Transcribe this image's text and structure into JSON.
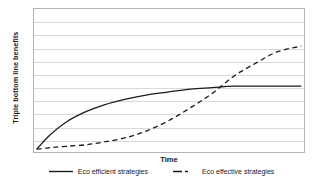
{
  "chart_data": {
    "type": "line",
    "title": "",
    "xlabel": "Time",
    "ylabel": "Triple bottom line benefits",
    "xlim": [
      0,
      100
    ],
    "ylim": [
      0,
      100
    ],
    "grid": true,
    "grid_lines": 10,
    "axis_ticks_shown": false,
    "legend_position": "bottom",
    "crossover": {
      "x": 69,
      "y": 43
    },
    "series": [
      {
        "name": "Eco efficient strategies",
        "style": "solid",
        "color": "#1a1a1a",
        "shape": "concave-logarithmic",
        "x": [
          1,
          6,
          12,
          19,
          26,
          34,
          42,
          50,
          58,
          66,
          74,
          82,
          90,
          99
        ],
        "values": [
          2,
          12,
          21,
          28,
          33,
          37,
          40,
          42,
          44,
          45,
          46,
          46,
          46,
          46
        ]
      },
      {
        "name": "Eco effective strategies",
        "style": "dashed",
        "color": "#1a1a1a",
        "shape": "sigmoid-s-curve",
        "x": [
          1,
          6,
          12,
          19,
          26,
          34,
          42,
          50,
          58,
          66,
          74,
          82,
          90,
          99
        ],
        "values": [
          2,
          3,
          4,
          5,
          7,
          10,
          15,
          22,
          31,
          41,
          53,
          62,
          70,
          74
        ]
      }
    ]
  },
  "axes": {
    "x_title": "Time",
    "y_title": "Triple bottom line benefits"
  },
  "legend": {
    "items": [
      {
        "label": "Eco efficient strategies",
        "style": "solid"
      },
      {
        "label": "Eco effective strategies",
        "style": "dashed"
      }
    ]
  },
  "colors": {
    "line": "#1a1a1a",
    "grid": "#d9d9d9",
    "frame": "#b4b4b4",
    "background": "#ffffff"
  }
}
